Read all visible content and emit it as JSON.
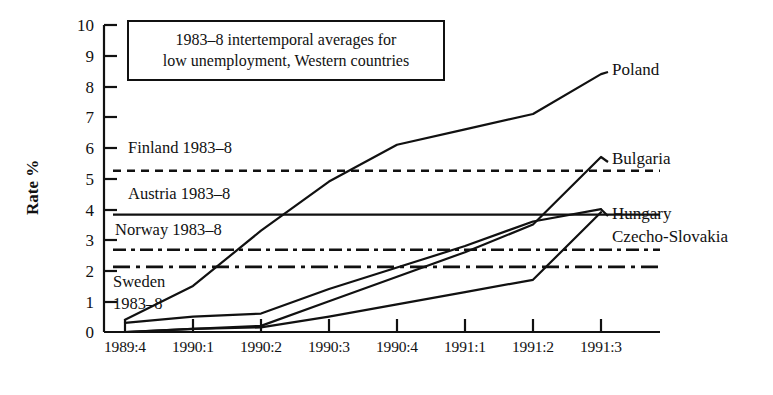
{
  "figure": {
    "callout": {
      "line1": "1983–8 intertemporal averages for",
      "line2": "low unemployment, Western countries"
    },
    "y_axis_title": "Rate %",
    "reference_labels": {
      "finland": "Finland 1983–8",
      "austria": "Austria  1983–8",
      "norway": "Norway 1983–8",
      "sweden_line1": "Sweden",
      "sweden_line2": "1983–8"
    },
    "series_labels": {
      "poland": "Poland",
      "bulgaria": "Bulgaria",
      "hungary": "Hungary",
      "czecho_slovakia": "Czecho-Slovakia"
    }
  },
  "chart_data": {
    "type": "line",
    "title": "1983–8 intertemporal averages for low unemployment, Western countries",
    "xlabel": "",
    "ylabel": "Rate %",
    "ylim": [
      0,
      10
    ],
    "yticks": [
      0,
      1,
      2,
      3,
      4,
      5,
      6,
      7,
      8,
      9,
      10
    ],
    "grid": false,
    "legend": "inline-right-labels",
    "categories": [
      "1989:4",
      "1990:1",
      "1990:2",
      "1990:3",
      "1990:4",
      "1991:1",
      "1991:2",
      "1991:3"
    ],
    "series": [
      {
        "name": "Poland",
        "style": "solid",
        "values": [
          0.4,
          1.5,
          3.3,
          4.9,
          6.1,
          6.6,
          7.1,
          8.4
        ]
      },
      {
        "name": "Bulgaria",
        "style": "solid",
        "values": [
          0.0,
          0.1,
          0.2,
          1.0,
          1.8,
          2.6,
          3.5,
          5.7
        ]
      },
      {
        "name": "Hungary",
        "style": "solid",
        "values": [
          0.3,
          0.5,
          0.6,
          1.4,
          2.1,
          2.8,
          3.6,
          4.0
        ]
      },
      {
        "name": "Czecho-Slovakia",
        "style": "solid",
        "values": [
          0.0,
          0.1,
          0.15,
          0.5,
          0.9,
          1.3,
          1.7,
          3.9
        ]
      }
    ],
    "reference_lines": [
      {
        "name": "Finland 1983–8",
        "value": 5.25,
        "style": "dashed"
      },
      {
        "name": "Austria 1983–8",
        "value": 3.82,
        "style": "solid"
      },
      {
        "name": "Norway 1983–8",
        "value": 2.68,
        "style": "dash-dot"
      },
      {
        "name": "Sweden 1983–8",
        "value": 2.12,
        "style": "dash-dot"
      }
    ],
    "colors": {
      "line": "#111111",
      "background": "#ffffff"
    }
  }
}
